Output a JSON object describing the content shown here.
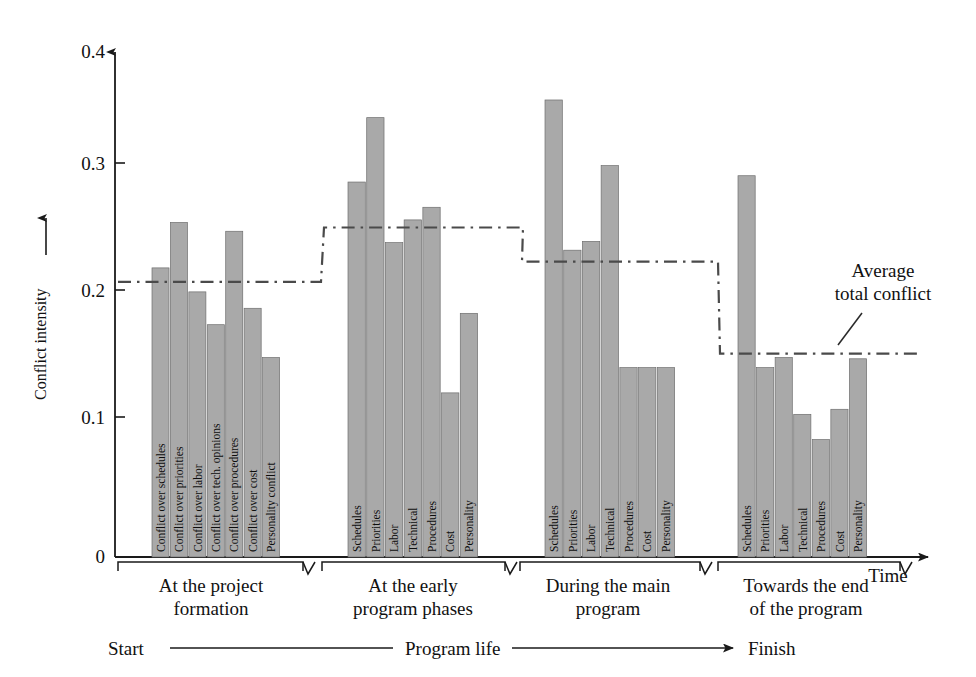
{
  "chart_data": {
    "type": "bar",
    "title": "",
    "xlabel": "Time",
    "ylabel": "Conflict intensity",
    "ylim": [
      0,
      0.4
    ],
    "yticks": [
      "0",
      "0.1",
      "0.2",
      "0.3",
      "0.4"
    ],
    "ytick_values": [
      0,
      0.1,
      0.2,
      0.3,
      0.4
    ],
    "grid": false,
    "legend": "none",
    "bar_color": "#a9a9a9",
    "bar_edge_color": "#6e6e6e",
    "axis_color": "#1a1a1a",
    "average_line_color": "#4a4a4a",
    "average_line_style": "dash-dot",
    "annotation": {
      "line1": "Average",
      "line2": "total conflict"
    },
    "timeline": {
      "start_label": "Start",
      "middle_label": "Program life",
      "end_label": "Finish"
    },
    "groups": [
      {
        "caption_line1": "At the project",
        "caption_line2": "formation",
        "average_total_conflict": 0.218,
        "categories": [
          "Conflict over schedules",
          "Conflict over priorities",
          "Conflict over labor",
          "Conflict over tech. opinions",
          "Conflict over procedures",
          "Conflict over cost",
          "Personality conflict"
        ],
        "values": [
          0.229,
          0.265,
          0.21,
          0.184,
          0.258,
          0.197,
          0.158
        ]
      },
      {
        "caption_line1": "At the early",
        "caption_line2": "program phases",
        "average_total_conflict": 0.261,
        "categories": [
          "Schedules",
          "Priorities",
          "Labor",
          "Technical",
          "Procedures",
          "Cost",
          "Personality"
        ],
        "values": [
          0.297,
          0.348,
          0.249,
          0.267,
          0.277,
          0.13,
          0.193
        ]
      },
      {
        "caption_line1": "During the main",
        "caption_line2": "program",
        "average_total_conflict": 0.234,
        "categories": [
          "Schedules",
          "Priorities",
          "Labor",
          "Technical",
          "Procedures",
          "Cost",
          "Personality"
        ],
        "values": [
          0.362,
          0.243,
          0.25,
          0.31,
          0.15,
          0.15,
          0.15
        ]
      },
      {
        "caption_line1": "Towards the end",
        "caption_line2": "of the program",
        "average_total_conflict": 0.161,
        "categories": [
          "Schedules",
          "Priorities",
          "Labor",
          "Technical",
          "Procedures",
          "Cost",
          "Personality"
        ],
        "values": [
          0.302,
          0.15,
          0.158,
          0.113,
          0.093,
          0.117,
          0.157
        ]
      }
    ]
  }
}
